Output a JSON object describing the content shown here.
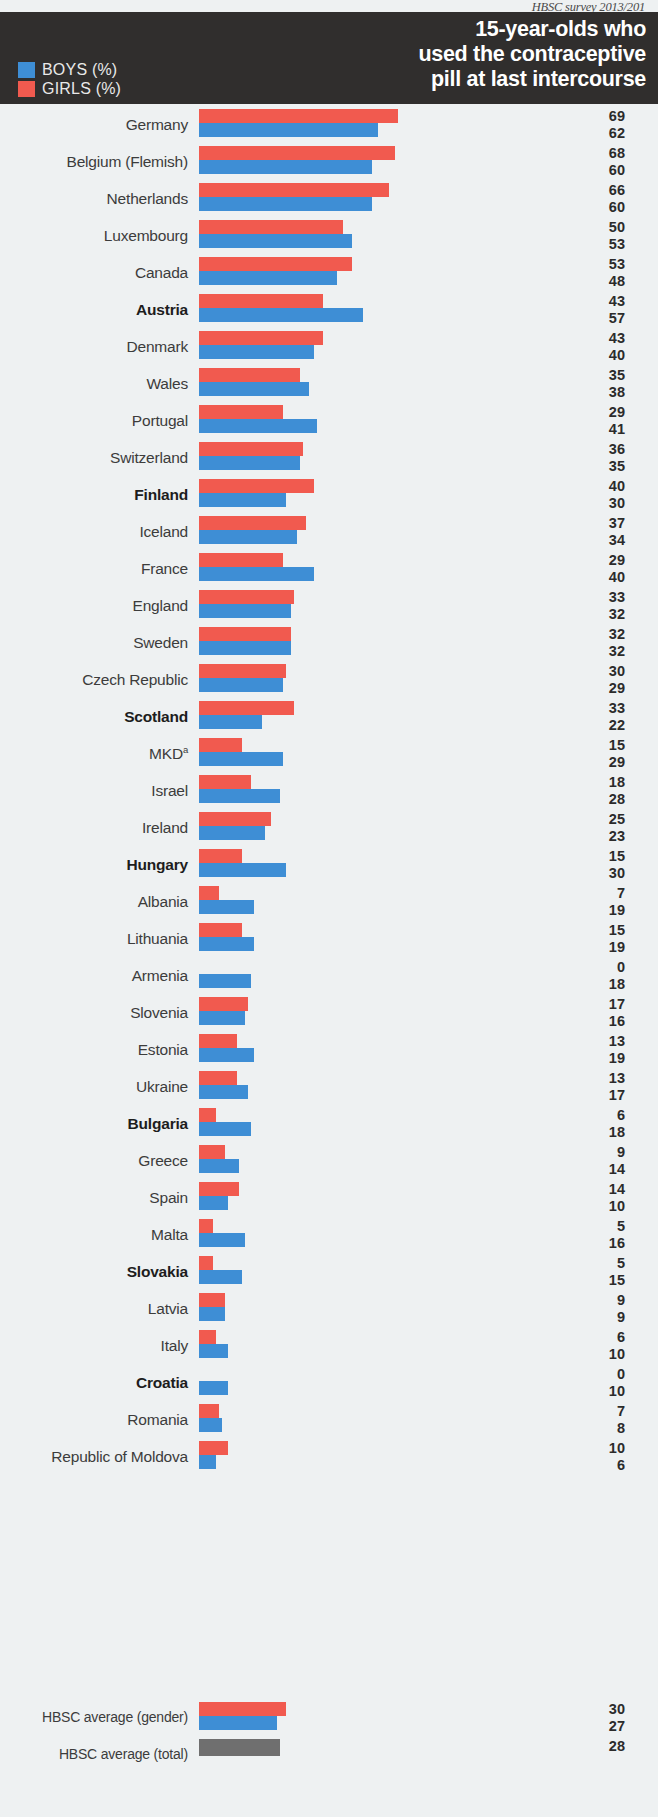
{
  "source_note": "HBSC survey 2013/201",
  "header": {
    "title_line1": "15-year-olds who",
    "title_line2": "used the contraceptive",
    "title_line3": "pill at last intercourse",
    "legend": [
      {
        "label": "BOYS (%)",
        "color": "#3e8ed5",
        "key": "boys"
      },
      {
        "label": "GIRLS (%)",
        "color": "#f15a4f",
        "key": "girls"
      }
    ]
  },
  "colors": {
    "boys": "#3e8ed5",
    "girls": "#f15a4f",
    "total": "#6f6f6f",
    "header_band": "#302e2d",
    "page_background": "#eef1f2"
  },
  "averages": {
    "gender_label": "HBSC average (gender)",
    "gender_girls": 30,
    "gender_boys": 27,
    "total_label": "HBSC average (total)",
    "total_value": 28
  },
  "chart_data": {
    "type": "bar",
    "title": "15-year-olds who used the contraceptive pill at last intercourse",
    "subtitle": "HBSC survey 2013/201",
    "orientation": "horizontal",
    "xlabel": "",
    "ylabel": "",
    "xlim": [
      0,
      70
    ],
    "grid": false,
    "legend_position": "top-left",
    "units": "%",
    "categories": [
      "Germany",
      "Belgium (Flemish)",
      "Netherlands",
      "Luxembourg",
      "Canada",
      "Austria",
      "Denmark",
      "Wales",
      "Portugal",
      "Switzerland",
      "Finland",
      "Iceland",
      "France",
      "England",
      "Sweden",
      "Czech Republic",
      "Scotland",
      "MKD",
      "Israel",
      "Ireland",
      "Hungary",
      "Albania",
      "Lithuania",
      "Armenia",
      "Slovenia",
      "Estonia",
      "Ukraine",
      "Bulgaria",
      "Greece",
      "Spain",
      "Malta",
      "Slovakia",
      "Latvia",
      "Italy",
      "Croatia",
      "Romania",
      "Republic of Moldova"
    ],
    "series": [
      {
        "name": "GIRLS (%)",
        "color": "#f15a4f",
        "values": [
          69,
          68,
          66,
          50,
          53,
          43,
          43,
          35,
          29,
          36,
          40,
          37,
          29,
          33,
          32,
          30,
          33,
          15,
          18,
          25,
          15,
          7,
          15,
          0,
          17,
          13,
          13,
          6,
          9,
          14,
          5,
          5,
          9,
          6,
          0,
          7,
          10
        ]
      },
      {
        "name": "BOYS (%)",
        "color": "#3e8ed5",
        "values": [
          62,
          60,
          60,
          53,
          48,
          57,
          40,
          38,
          41,
          35,
          30,
          34,
          40,
          32,
          32,
          29,
          22,
          29,
          28,
          23,
          30,
          19,
          19,
          18,
          16,
          19,
          17,
          18,
          14,
          10,
          16,
          15,
          9,
          10,
          10,
          8,
          6
        ]
      }
    ],
    "annotations": [
      {
        "category": "MKD",
        "marker": "a",
        "type": "footnote-superscript"
      }
    ]
  },
  "rows": [
    {
      "label": "Germany",
      "sup": "",
      "bold": false,
      "girls": 69,
      "boys": 62
    },
    {
      "label": "Belgium (Flemish)",
      "sup": "",
      "bold": false,
      "girls": 68,
      "boys": 60
    },
    {
      "label": "Netherlands",
      "sup": "",
      "bold": false,
      "girls": 66,
      "boys": 60
    },
    {
      "label": "Luxembourg",
      "sup": "",
      "bold": false,
      "girls": 50,
      "boys": 53
    },
    {
      "label": "Canada",
      "sup": "",
      "bold": false,
      "girls": 53,
      "boys": 48
    },
    {
      "label": "Austria",
      "sup": "",
      "bold": true,
      "girls": 43,
      "boys": 57
    },
    {
      "label": "Denmark",
      "sup": "",
      "bold": false,
      "girls": 43,
      "boys": 40
    },
    {
      "label": "Wales",
      "sup": "",
      "bold": false,
      "girls": 35,
      "boys": 38
    },
    {
      "label": "Portugal",
      "sup": "",
      "bold": false,
      "girls": 29,
      "boys": 41
    },
    {
      "label": "Switzerland",
      "sup": "",
      "bold": false,
      "girls": 36,
      "boys": 35
    },
    {
      "label": "Finland",
      "sup": "",
      "bold": true,
      "girls": 40,
      "boys": 30
    },
    {
      "label": "Iceland",
      "sup": "",
      "bold": false,
      "girls": 37,
      "boys": 34
    },
    {
      "label": "France",
      "sup": "",
      "bold": false,
      "girls": 29,
      "boys": 40
    },
    {
      "label": "England",
      "sup": "",
      "bold": false,
      "girls": 33,
      "boys": 32
    },
    {
      "label": "Sweden",
      "sup": "",
      "bold": false,
      "girls": 32,
      "boys": 32
    },
    {
      "label": "Czech Republic",
      "sup": "",
      "bold": false,
      "girls": 30,
      "boys": 29
    },
    {
      "label": "Scotland",
      "sup": "",
      "bold": true,
      "girls": 33,
      "boys": 22
    },
    {
      "label": "MKD",
      "sup": "a",
      "bold": false,
      "girls": 15,
      "boys": 29
    },
    {
      "label": "Israel",
      "sup": "",
      "bold": false,
      "girls": 18,
      "boys": 28
    },
    {
      "label": "Ireland",
      "sup": "",
      "bold": false,
      "girls": 25,
      "boys": 23
    },
    {
      "label": "Hungary",
      "sup": "",
      "bold": true,
      "girls": 15,
      "boys": 30
    },
    {
      "label": "Albania",
      "sup": "",
      "bold": false,
      "girls": 7,
      "boys": 19
    },
    {
      "label": "Lithuania",
      "sup": "",
      "bold": false,
      "girls": 15,
      "boys": 19
    },
    {
      "label": "Armenia",
      "sup": "",
      "bold": false,
      "girls": 0,
      "boys": 18
    },
    {
      "label": "Slovenia",
      "sup": "",
      "bold": false,
      "girls": 17,
      "boys": 16
    },
    {
      "label": "Estonia",
      "sup": "",
      "bold": false,
      "girls": 13,
      "boys": 19
    },
    {
      "label": "Ukraine",
      "sup": "",
      "bold": false,
      "girls": 13,
      "boys": 17
    },
    {
      "label": "Bulgaria",
      "sup": "",
      "bold": true,
      "girls": 6,
      "boys": 18
    },
    {
      "label": "Greece",
      "sup": "",
      "bold": false,
      "girls": 9,
      "boys": 14
    },
    {
      "label": "Spain",
      "sup": "",
      "bold": false,
      "girls": 14,
      "boys": 10
    },
    {
      "label": "Malta",
      "sup": "",
      "bold": false,
      "girls": 5,
      "boys": 16
    },
    {
      "label": "Slovakia",
      "sup": "",
      "bold": true,
      "girls": 5,
      "boys": 15
    },
    {
      "label": "Latvia",
      "sup": "",
      "bold": false,
      "girls": 9,
      "boys": 9
    },
    {
      "label": "Italy",
      "sup": "",
      "bold": false,
      "girls": 6,
      "boys": 10
    },
    {
      "label": "Croatia",
      "sup": "",
      "bold": true,
      "girls": 0,
      "boys": 10
    },
    {
      "label": "Romania",
      "sup": "",
      "bold": false,
      "girls": 7,
      "boys": 8
    },
    {
      "label": "Republic of Moldova",
      "sup": "",
      "bold": false,
      "girls": 10,
      "boys": 6
    }
  ]
}
